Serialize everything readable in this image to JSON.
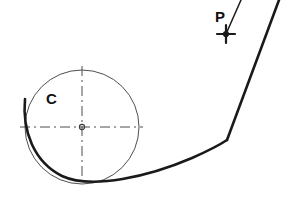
{
  "figure": {
    "background_color": "#ffffff",
    "width": 308,
    "height": 198
  },
  "labels": {
    "circle_center_label": "C",
    "point_label": "P"
  },
  "colors": {
    "stroke_dark": "#1a1a1a",
    "stroke_thin": "#3a3a3a",
    "centerline": "#4d4d4d",
    "background": "#ffffff"
  },
  "geometry": {
    "base_circle": {
      "name": "generating-circle",
      "center_x": 82,
      "center_y": 127,
      "radius": 57,
      "stroke_width": 0.9
    },
    "center_mark": {
      "name": "center-point",
      "x": 82,
      "y": 127,
      "radius": 2.6
    },
    "horizontal_centerline": {
      "x1": 20,
      "y1": 127,
      "x2": 143,
      "y2": 127,
      "dash": "10 4 2 4"
    },
    "vertical_centerline": {
      "x1": 82,
      "y1": 66,
      "x2": 82,
      "y2": 186,
      "dash": "10 4 2 4"
    },
    "involute_curve": {
      "name": "involute-spiral",
      "stroke_width": 2.6,
      "path": "M 25 99 C 22 131, 34 162, 62 176 C 92 190, 150 176, 192 158 C 210 150, 221 144, 227 140"
    },
    "outer_leg": {
      "name": "involute-outer-leg",
      "stroke_width": 2.6,
      "x1": 227,
      "y1": 140,
      "x2": 279,
      "y2": 0
    },
    "tangent_line": {
      "name": "generating-tangent-line",
      "stroke_width": 1.5,
      "x1": 226,
      "y1": 34,
      "x2": 241,
      "y2": 0
    },
    "point_marker": {
      "name": "point-p-marker",
      "x": 226,
      "y": 34,
      "arm_length": 9,
      "dot_radius": 3.1
    }
  }
}
